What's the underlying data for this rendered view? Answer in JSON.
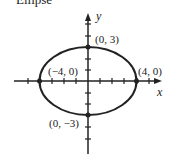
{
  "title": "Ellipse",
  "axes": {
    "x_label": "x",
    "y_label": "y"
  },
  "points": [
    {
      "label": "(0, 3)"
    },
    {
      "label": "(4, 0)"
    },
    {
      "label": "(−4, 0)"
    },
    {
      "label": "(0, −3)"
    }
  ],
  "ellipse": {
    "center": "(0, 0)",
    "a": 4,
    "b": 3
  }
}
